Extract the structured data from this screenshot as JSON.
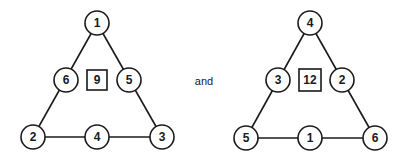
{
  "diagram": {
    "conjunction": "and",
    "triangles": [
      {
        "side_sum": "9",
        "top": "1",
        "mid_left": "6",
        "mid_right": "5",
        "bottom_left": "2",
        "bottom_mid": "4",
        "bottom_right": "3"
      },
      {
        "side_sum": "12",
        "top": "4",
        "mid_left": "3",
        "mid_right": "2",
        "bottom_left": "5",
        "bottom_mid": "1",
        "bottom_right": "6"
      }
    ]
  }
}
